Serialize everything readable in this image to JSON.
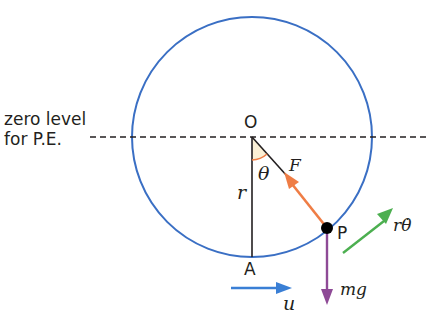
{
  "diagram": {
    "type": "circular motion in vertical circle",
    "zero_level_label": [
      "zero level",
      "for P.E."
    ],
    "points": {
      "center": "O",
      "bottom": "A",
      "particle": "P"
    },
    "labels": {
      "radius": "r",
      "angle": "θ",
      "force": "F",
      "weight": "mg",
      "initial_velocity": "u",
      "tangential_velocity": "rθ̇"
    },
    "colors": {
      "circle": "#3a6fc4",
      "force_arrow": "#ef7d45",
      "weight_arrow": "#8e4a96",
      "velocity_u_arrow": "#3a7fd5",
      "tangential_velocity_arrow": "#4caf50",
      "angle_arc": "#ef7d45",
      "angle_fill": "#fbf0d6"
    }
  }
}
